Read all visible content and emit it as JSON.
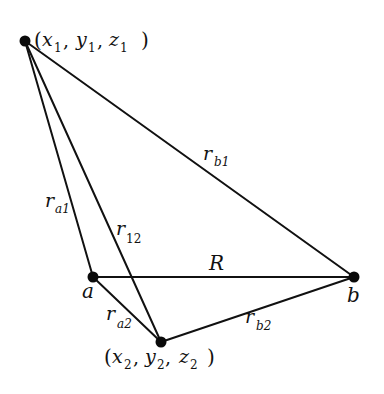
{
  "diagram": {
    "points": {
      "p1": {
        "label_parts": [
          "(x",
          "1",
          ", y",
          "1",
          ", z",
          "1",
          ")"
        ],
        "x": 25,
        "y": 41
      },
      "a": {
        "label": "a",
        "x": 93,
        "y": 277
      },
      "b": {
        "label": "b",
        "x": 354,
        "y": 277
      },
      "p2": {
        "label_parts": [
          "(x",
          "2",
          ", y",
          "2",
          ", z",
          "2",
          ")"
        ],
        "x": 161,
        "y": 342
      }
    },
    "edges": [
      {
        "from": "p1",
        "to": "b",
        "label": "r",
        "sub": "b1"
      },
      {
        "from": "p1",
        "to": "a",
        "label": "r",
        "sub": "a1"
      },
      {
        "from": "p1",
        "to": "p2",
        "label": "r",
        "sub": "12"
      },
      {
        "from": "a",
        "to": "b",
        "label": "R",
        "sub": ""
      },
      {
        "from": "a",
        "to": "p2",
        "label": "r",
        "sub": "a2"
      },
      {
        "from": "p2",
        "to": "b",
        "label": "r",
        "sub": "b2"
      }
    ],
    "labels": {
      "p1_open": "(",
      "p1_x": "x",
      "p1_xs": "1",
      "p1_y": "y",
      "p1_ys": "1",
      "p1_z": "z",
      "p1_zs": "1",
      "p1_close": ")",
      "p2_open": "(",
      "p2_x": "x",
      "p2_xs": "2",
      "p2_y": "y",
      "p2_ys": "2",
      "p2_z": "z",
      "p2_zs": "2",
      "p2_close": ")",
      "comma": ",",
      "a": "a",
      "b": "b",
      "R": "R",
      "rb1": "r",
      "rb1_sub": "b1",
      "ra1": "r",
      "ra1_sub": "a1",
      "r12": "r",
      "r12_sub": "12",
      "ra2": "r",
      "ra2_sub": "a2",
      "rb2": "r",
      "rb2_sub": "b2"
    }
  }
}
